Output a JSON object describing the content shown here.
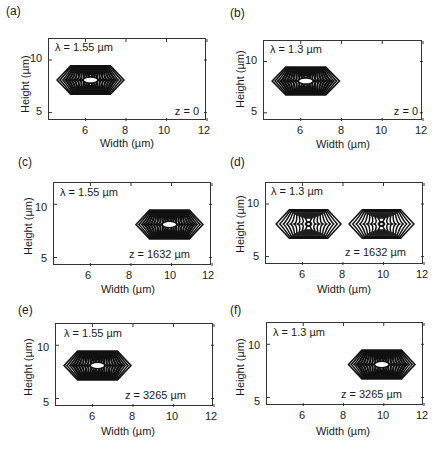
{
  "chart_data": [
    {
      "type": "contour",
      "panel": "(a)",
      "wavelength_label": "λ = 1.55 µm",
      "z_label": "z = 0",
      "xlabel": "Width (µm)",
      "ylabel": "Height (µm)",
      "xticks": [
        6,
        8,
        10,
        12
      ],
      "yticks": [
        5,
        10
      ],
      "xlim": [
        4.2,
        12
      ],
      "ylim": [
        4.2,
        12
      ],
      "grid": false,
      "modes": [
        {
          "center_x": 6.25,
          "center_y": 8.1,
          "half_width": 1.65,
          "half_height": 1.35,
          "levels": 12,
          "peak": "filled"
        }
      ]
    },
    {
      "type": "contour",
      "panel": "(b)",
      "wavelength_label": "λ = 1.3 µm",
      "z_label": "z = 0",
      "xlabel": "Width (µm)",
      "ylabel": "Height (µm)",
      "xticks": [
        6,
        8,
        10,
        12
      ],
      "yticks": [
        5,
        10
      ],
      "xlim": [
        4.2,
        12
      ],
      "ylim": [
        4.2,
        12
      ],
      "grid": false,
      "modes": [
        {
          "center_x": 6.25,
          "center_y": 8.1,
          "half_width": 1.65,
          "half_height": 1.35,
          "levels": 12,
          "peak": "filled"
        }
      ]
    },
    {
      "type": "contour",
      "panel": "(c)",
      "wavelength_label": "λ = 1.55 µm",
      "z_label": "z = 1632 µm",
      "xlabel": "Width (µm)",
      "ylabel": "Height (µm)",
      "xticks": [
        6,
        8,
        10,
        12
      ],
      "yticks": [
        5,
        10
      ],
      "xlim": [
        4.2,
        12
      ],
      "ylim": [
        4.2,
        12
      ],
      "grid": false,
      "modes": [
        {
          "center_x": 9.9,
          "center_y": 8.1,
          "half_width": 1.65,
          "half_height": 1.35,
          "levels": 12,
          "peak": "filled"
        }
      ]
    },
    {
      "type": "contour",
      "panel": "(d)",
      "wavelength_label": "λ = 1.3 µm",
      "z_label": "z = 1632 µm",
      "xlabel": "Width (µm)",
      "ylabel": "Height (µm)",
      "xticks": [
        6,
        8,
        10,
        12
      ],
      "yticks": [
        5,
        10
      ],
      "xlim": [
        4.2,
        12
      ],
      "ylim": [
        4.2,
        12
      ],
      "grid": false,
      "modes": [
        {
          "center_x": 6.3,
          "center_y": 8.1,
          "half_width": 1.6,
          "half_height": 1.35,
          "levels": 9,
          "peak": "dot"
        },
        {
          "center_x": 9.9,
          "center_y": 8.1,
          "half_width": 1.6,
          "half_height": 1.35,
          "levels": 9,
          "peak": "dot"
        }
      ]
    },
    {
      "type": "contour",
      "panel": "(e)",
      "wavelength_label": "λ = 1.55 µm",
      "z_label": "z = 3265 µm",
      "xlabel": "Width (µm)",
      "ylabel": "Height (µm)",
      "xticks": [
        6,
        8,
        10,
        12
      ],
      "yticks": [
        5,
        10
      ],
      "xlim": [
        4.2,
        12
      ],
      "ylim": [
        4.2,
        12
      ],
      "grid": false,
      "modes": [
        {
          "center_x": 6.25,
          "center_y": 8.1,
          "half_width": 1.65,
          "half_height": 1.35,
          "levels": 12,
          "peak": "filled"
        }
      ]
    },
    {
      "type": "contour",
      "panel": "(f)",
      "wavelength_label": "λ = 1.3 µm",
      "z_label": "z = 3265 µm",
      "xlabel": "Width (µm)",
      "ylabel": "Height (µm)",
      "xticks": [
        6,
        8,
        10,
        12
      ],
      "yticks": [
        5,
        10
      ],
      "xlim": [
        4.2,
        12
      ],
      "ylim": [
        4.2,
        12
      ],
      "grid": false,
      "modes": [
        {
          "center_x": 9.9,
          "center_y": 8.1,
          "half_width": 1.65,
          "half_height": 1.35,
          "levels": 12,
          "peak": "filled"
        }
      ]
    }
  ],
  "panels": [
    {
      "label": "(a)",
      "lambda": "λ = 1.55 µm",
      "z": "z = 0",
      "xlabel": "Width (µm)",
      "ylabel": "Height (µm)",
      "xt": [
        "6",
        "8",
        "10",
        "12"
      ],
      "yt": [
        "10",
        "5"
      ]
    },
    {
      "label": "(b)",
      "lambda": "λ = 1.3 µm",
      "z": "z = 0",
      "xlabel": "Width (µm)",
      "ylabel": "Height (µm)",
      "xt": [
        "6",
        "8",
        "10",
        "12"
      ],
      "yt": [
        "10",
        "5"
      ]
    },
    {
      "label": "(c)",
      "lambda": "λ = 1.55 µm",
      "z": "z = 1632 µm",
      "xlabel": "Width (µm)",
      "ylabel": "Height (µm)",
      "xt": [
        "6",
        "8",
        "10",
        "12"
      ],
      "yt": [
        "10",
        "5"
      ]
    },
    {
      "label": "(d)",
      "lambda": "λ = 1.3 µm",
      "z": "z = 1632 µm",
      "xlabel": "Width (µm)",
      "ylabel": "Height (µm)",
      "xt": [
        "6",
        "8",
        "10",
        "12"
      ],
      "yt": [
        "10",
        "5"
      ]
    },
    {
      "label": "(e)",
      "lambda": "λ = 1.55 µm",
      "z": "z = 3265 µm",
      "xlabel": "Width (µm)",
      "ylabel": "Height (µm)",
      "xt": [
        "6",
        "8",
        "10",
        "12"
      ],
      "yt": [
        "10",
        "5"
      ]
    },
    {
      "label": "(f)",
      "lambda": "λ = 1.3 µm",
      "z": "z = 3265 µm",
      "xlabel": "Width (µm)",
      "ylabel": "Height (µm)",
      "xt": [
        "6",
        "8",
        "10",
        "12"
      ],
      "yt": [
        "10",
        "5"
      ]
    }
  ],
  "colors": {
    "contour": "#111111",
    "axis": "#333333",
    "background": "#ffffff"
  }
}
